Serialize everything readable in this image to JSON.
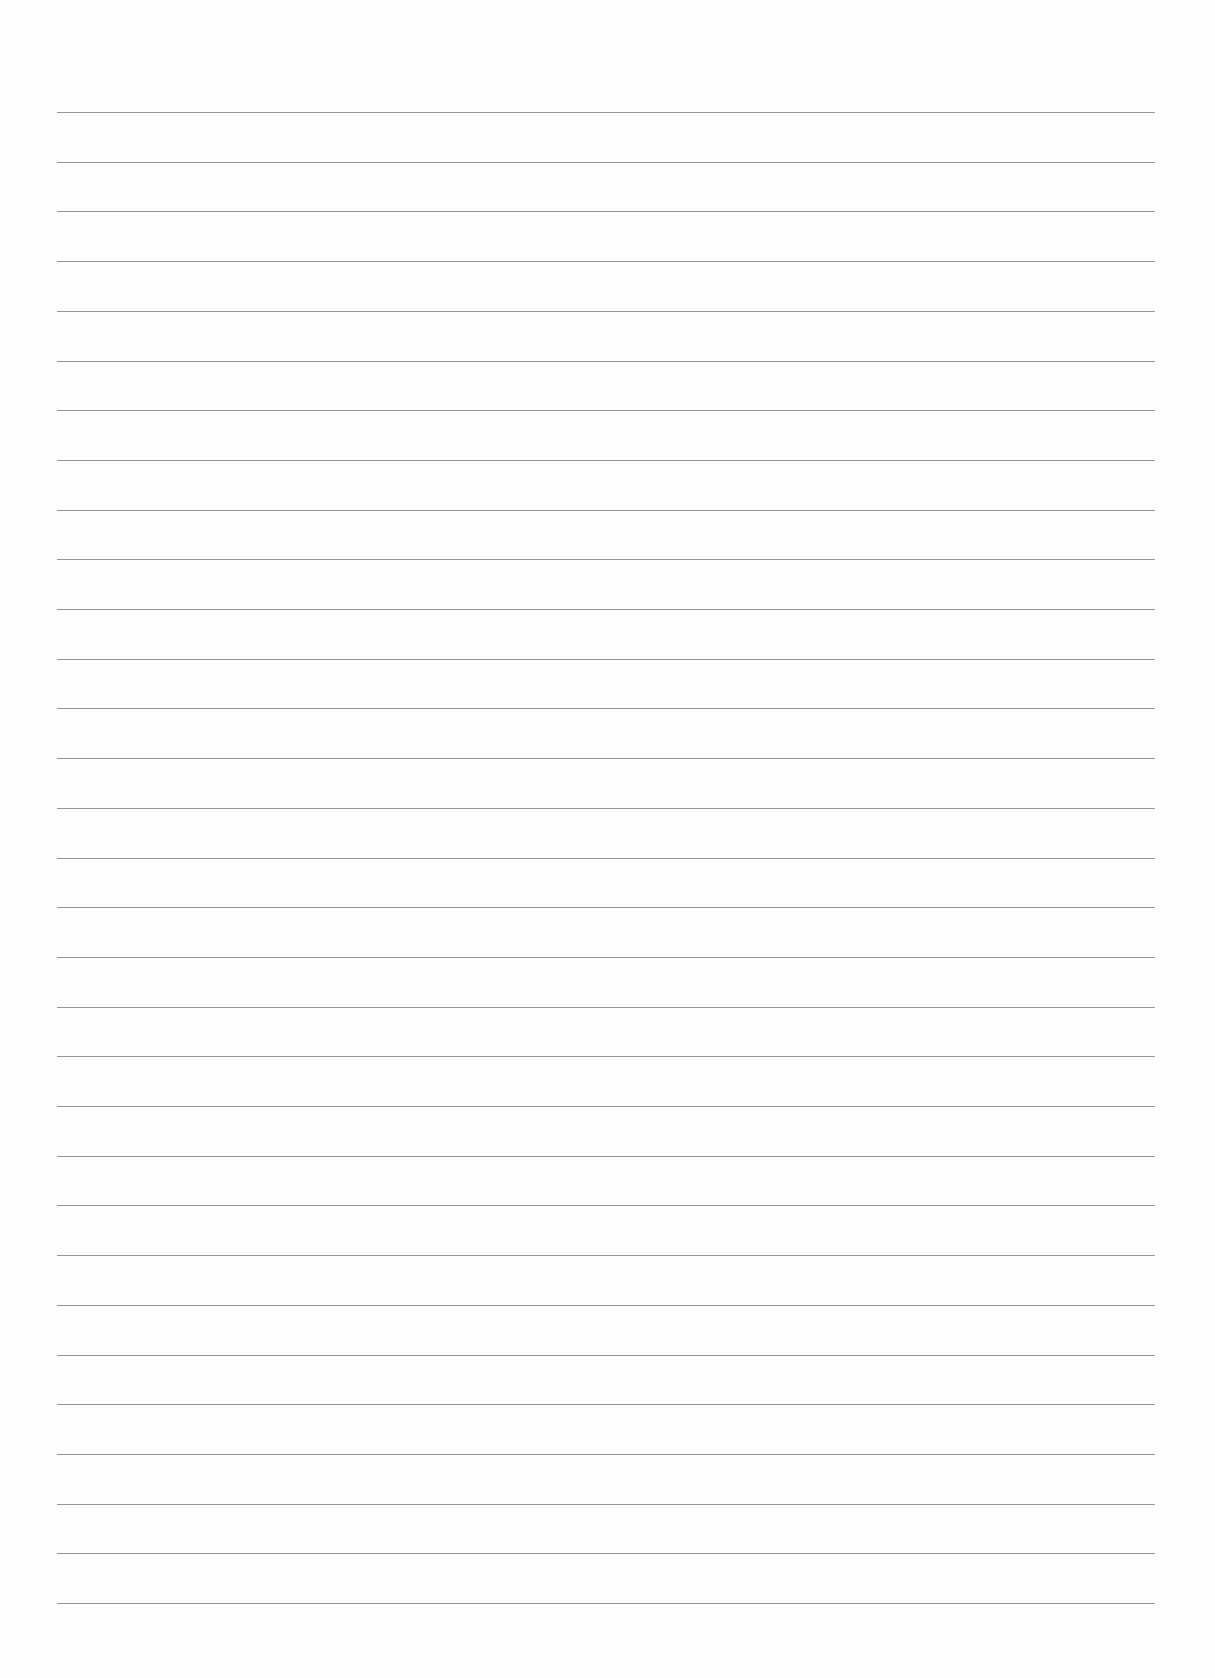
{
  "page": {
    "background": "#fdfdfd",
    "line_color": "#8a8a8a",
    "line_count": 31,
    "first_line_y": 112,
    "last_line_y": 1603,
    "line_left_x": 57,
    "line_right_x": 1155
  }
}
